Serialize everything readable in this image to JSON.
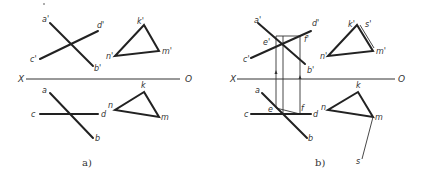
{
  "figure_a": {
    "caption": "a)",
    "axis": {
      "left": "X",
      "right": "O"
    },
    "front_view": {
      "labels": {
        "a": "a'",
        "b": "b'",
        "c": "c'",
        "d": "d'",
        "k": "k'",
        "n": "n'",
        "m": "m'"
      }
    },
    "top_view": {
      "labels": {
        "a": "a",
        "b": "b",
        "c": "c",
        "d": "d",
        "k": "k",
        "n": "n",
        "m": "m"
      }
    }
  },
  "figure_b": {
    "caption": "b)",
    "axis": {
      "left": "X",
      "right": "O"
    },
    "front_view": {
      "labels": {
        "a": "a'",
        "b": "b'",
        "c": "c'",
        "d": "d'",
        "e": "e'",
        "f": "f'",
        "k": "k'",
        "s": "s'",
        "n": "n'",
        "m": "m'"
      }
    },
    "top_view": {
      "labels": {
        "a": "a",
        "b": "b",
        "c": "c",
        "d": "d",
        "e": "e",
        "f": "f",
        "k": "k",
        "n": "n",
        "m": "m",
        "s": "s"
      }
    }
  }
}
